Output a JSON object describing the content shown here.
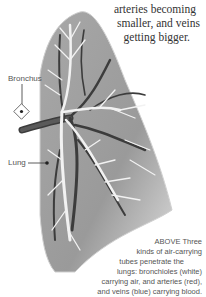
{
  "top_caption": {
    "lines": [
      "arteries becoming",
      "smaller, and veins",
      "getting bigger."
    ]
  },
  "labels": {
    "bronchus": "Bronchus",
    "lung": "Lung"
  },
  "bottom_caption": {
    "lines": [
      "ABOVE Three",
      "kinds of air-carrying",
      "tubes penetrate the",
      "lungs: bronchioles (white)",
      "carrying air, and arteries (red),",
      "and veins (blue) carrying blood."
    ]
  },
  "colors": {
    "lung_fill": "#9a9a9a",
    "lung_edge": "#c8c8c8",
    "bronchioles": "#f2f2f2",
    "vessels_dark": "#3c3c3c"
  }
}
